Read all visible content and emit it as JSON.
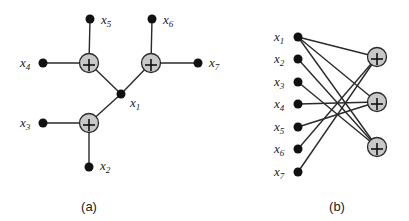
{
  "figure": {
    "panel_a": {
      "caption": "(a)",
      "labels": {
        "x1": {
          "base": "x",
          "sub": "1"
        },
        "x2": {
          "base": "x",
          "sub": "2"
        },
        "x3": {
          "base": "x",
          "sub": "3"
        },
        "x4": {
          "base": "x",
          "sub": "4"
        },
        "x5": {
          "base": "x",
          "sub": "5"
        },
        "x6": {
          "base": "x",
          "sub": "6"
        },
        "x7": {
          "base": "x",
          "sub": "7"
        }
      },
      "sum_node_symbol": "+",
      "description": "Tree: central node x1 connects to three summation nodes; each summation node connects to two leaf variables (x4,x5), (x6,x7), (x3,x2)."
    },
    "panel_b": {
      "caption": "(b)",
      "variables": [
        {
          "base": "x",
          "sub": "1"
        },
        {
          "base": "x",
          "sub": "2"
        },
        {
          "base": "x",
          "sub": "3"
        },
        {
          "base": "x",
          "sub": "4"
        },
        {
          "base": "x",
          "sub": "5"
        },
        {
          "base": "x",
          "sub": "6"
        },
        {
          "base": "x",
          "sub": "7"
        }
      ],
      "factors": [
        "+",
        "+",
        "+"
      ],
      "edges": [
        [
          "x1",
          "f1"
        ],
        [
          "x1",
          "f2"
        ],
        [
          "x1",
          "f3"
        ],
        [
          "x2",
          "f3"
        ],
        [
          "x3",
          "f3"
        ],
        [
          "x4",
          "f2"
        ],
        [
          "x5",
          "f2"
        ],
        [
          "x6",
          "f1"
        ],
        [
          "x7",
          "f1"
        ]
      ],
      "description": "Bipartite graph: seven variable nodes on the left connected to three summation nodes on the right."
    }
  }
}
